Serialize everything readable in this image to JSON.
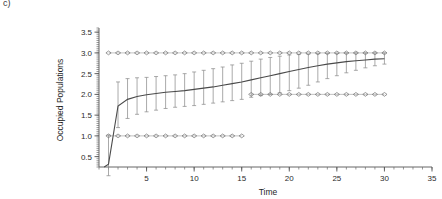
{
  "panel": {
    "label": "c)"
  },
  "chart_data": {
    "type": "line",
    "title": "",
    "xlabel": "Time",
    "ylabel": "Occupied Populations",
    "xlim": [
      0,
      35
    ],
    "ylim": [
      0.25,
      3.6
    ],
    "grid": false,
    "legend_position": "none",
    "x_ticks": [
      5,
      10,
      15,
      20,
      25,
      30,
      35
    ],
    "x_tick_labels": [
      "5",
      "10",
      "15",
      "20",
      "25",
      "30",
      "35"
    ],
    "x_minor_tick_step": 1,
    "y_ticks": [
      0.5,
      1.0,
      1.5,
      2.0,
      2.5,
      3.0,
      3.5
    ],
    "y_tick_labels": [
      "0.5",
      "1.0",
      "1.5",
      "2.0",
      "2.5",
      "3.0",
      "3.5"
    ],
    "y_minor_tick_step": 0.05,
    "series": [
      {
        "name": "mean",
        "style": "solid-line",
        "x": [
          1,
          2,
          3,
          4,
          5,
          6,
          7,
          8,
          9,
          10,
          11,
          12,
          13,
          14,
          15,
          16,
          17,
          18,
          19,
          20,
          21,
          22,
          23,
          24,
          25,
          26,
          27,
          28,
          29,
          30
        ],
        "values": [
          0.32,
          1.72,
          1.88,
          1.95,
          1.99,
          2.02,
          2.05,
          2.07,
          2.09,
          2.12,
          2.15,
          2.18,
          2.22,
          2.26,
          2.3,
          2.35,
          2.4,
          2.45,
          2.5,
          2.55,
          2.6,
          2.65,
          2.69,
          2.73,
          2.76,
          2.79,
          2.81,
          2.83,
          2.85,
          2.86
        ]
      },
      {
        "name": "error-bar-upper",
        "style": "whisker-top",
        "x": [
          1,
          2,
          3,
          4,
          5,
          6,
          7,
          8,
          9,
          10,
          11,
          12,
          13,
          14,
          15,
          16,
          17,
          18,
          19,
          20,
          21,
          22,
          23,
          24,
          25,
          26,
          27,
          28,
          29,
          30
        ],
        "values": [
          1.02,
          2.3,
          2.38,
          2.4,
          2.41,
          2.43,
          2.45,
          2.47,
          2.5,
          2.54,
          2.58,
          2.62,
          2.66,
          2.71,
          2.75,
          2.8,
          2.85,
          2.89,
          2.92,
          2.95,
          2.96,
          2.97,
          2.98,
          2.99,
          2.99,
          3.0,
          3.0,
          3.0,
          3.0,
          3.0
        ]
      },
      {
        "name": "error-bar-lower",
        "style": "whisker-bottom",
        "x": [
          1,
          2,
          3,
          4,
          5,
          6,
          7,
          8,
          9,
          10,
          11,
          12,
          13,
          14,
          15,
          16,
          17,
          18,
          19,
          20,
          21,
          22,
          23,
          24,
          25,
          26,
          27,
          28,
          29,
          30
        ],
        "values": [
          0.04,
          1.2,
          1.42,
          1.52,
          1.58,
          1.62,
          1.66,
          1.69,
          1.71,
          1.73,
          1.76,
          1.79,
          1.82,
          1.85,
          1.88,
          1.93,
          1.97,
          2.0,
          2.04,
          2.09,
          2.15,
          2.22,
          2.3,
          2.38,
          2.45,
          2.52,
          2.58,
          2.64,
          2.69,
          2.73
        ]
      },
      {
        "name": "maximum",
        "style": "diamond-markers",
        "x": [
          1,
          2,
          3,
          4,
          5,
          6,
          7,
          8,
          9,
          10,
          11,
          12,
          13,
          14,
          15,
          16,
          17,
          18,
          19,
          20,
          21,
          22,
          23,
          24,
          25,
          26,
          27,
          28,
          29,
          30
        ],
        "values": [
          3.0,
          3.0,
          3.0,
          3.0,
          3.0,
          3.0,
          3.0,
          3.0,
          3.0,
          3.0,
          3.0,
          3.0,
          3.0,
          3.0,
          3.0,
          3.0,
          3.0,
          3.0,
          3.0,
          3.0,
          3.0,
          3.0,
          3.0,
          3.0,
          3.0,
          3.0,
          3.0,
          3.0,
          3.0,
          3.0
        ]
      },
      {
        "name": "minimum",
        "style": "diamond-markers",
        "x": [
          1,
          2,
          3,
          4,
          5,
          6,
          7,
          8,
          9,
          10,
          11,
          12,
          13,
          14,
          15,
          16,
          17,
          18,
          19,
          20,
          21,
          22,
          23,
          24,
          25,
          26,
          27,
          28,
          29,
          30
        ],
        "values": [
          1.0,
          1.0,
          1.0,
          1.0,
          1.0,
          1.0,
          1.0,
          1.0,
          1.0,
          1.0,
          1.0,
          1.0,
          1.0,
          1.0,
          1.0,
          2.0,
          2.0,
          2.0,
          2.0,
          2.0,
          2.0,
          2.0,
          2.0,
          2.0,
          2.0,
          2.0,
          2.0,
          2.0,
          2.0,
          2.0
        ]
      }
    ]
  },
  "colors": {
    "mean_line": "#4a4a4a",
    "error_bar": "#8d8d8d",
    "marker": "#6f6f6f",
    "axis": "#555555",
    "background": "#ffffff"
  }
}
